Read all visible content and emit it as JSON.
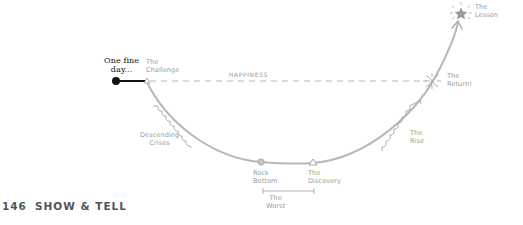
{
  "diagram": {
    "type": "story-arc",
    "top_clipped_text": "",
    "start_label": "One fine\nday...",
    "labels": {
      "challenge": "The\nChallenge",
      "happiness": "HAPPINESS",
      "descending_crises": "Descending\nCrises",
      "rock_bottom": "Rock\nBottom",
      "discovery": "The\nDiscovery",
      "the_worst": "The\nWorst",
      "the_rise": "The\nRise",
      "the_return": "The\nReturn!",
      "the_lesson": "The\nLesson"
    },
    "colors": {
      "curve": "#b5b5b5",
      "start_segment": "#111111",
      "dashed_line": "#b5b5b5",
      "label": "#9a9a9a",
      "footer": "#555555"
    },
    "points": {
      "start_dot": [
        116,
        81
      ],
      "challenge": [
        147,
        81
      ],
      "rock_bottom": [
        261,
        162
      ],
      "discovery": [
        313,
        163
      ],
      "return": [
        432,
        81
      ],
      "lesson": [
        461,
        13
      ]
    }
  },
  "footer": {
    "page_number": "146",
    "section_title": "SHOW & TELL"
  }
}
